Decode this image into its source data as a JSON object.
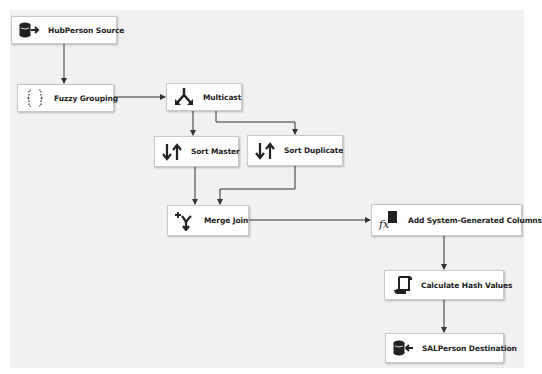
{
  "diagram": {
    "nodes": [
      {
        "id": "hubperson-source",
        "label": "HubPerson Source",
        "icon": "database-source-icon"
      },
      {
        "id": "fuzzy-grouping",
        "label": "Fuzzy Grouping",
        "icon": "fuzzy-braces-icon"
      },
      {
        "id": "multicast",
        "label": "Multicast",
        "icon": "multicast-split-icon"
      },
      {
        "id": "sort-master",
        "label": "Sort Master",
        "icon": "sort-arrows-icon"
      },
      {
        "id": "sort-duplicate",
        "label": "Sort Duplicate",
        "icon": "sort-arrows-icon"
      },
      {
        "id": "merge-join",
        "label": "Merge Join",
        "icon": "merge-join-icon"
      },
      {
        "id": "add-system-generated-columns",
        "label": "Add System-Generated Columns",
        "icon": "derived-column-fx-icon"
      },
      {
        "id": "calculate-hash-values",
        "label": "Calculate Hash Values",
        "icon": "script-scroll-icon"
      },
      {
        "id": "salperson-destination",
        "label": "SALPerson Destination",
        "icon": "database-destination-icon"
      }
    ],
    "edges": [
      {
        "from": "hubperson-source",
        "to": "fuzzy-grouping"
      },
      {
        "from": "fuzzy-grouping",
        "to": "multicast"
      },
      {
        "from": "multicast",
        "to": "sort-master"
      },
      {
        "from": "multicast",
        "to": "sort-duplicate"
      },
      {
        "from": "sort-master",
        "to": "merge-join"
      },
      {
        "from": "sort-duplicate",
        "to": "merge-join"
      },
      {
        "from": "merge-join",
        "to": "add-system-generated-columns"
      },
      {
        "from": "add-system-generated-columns",
        "to": "calculate-hash-values"
      },
      {
        "from": "calculate-hash-values",
        "to": "salperson-destination"
      }
    ]
  }
}
